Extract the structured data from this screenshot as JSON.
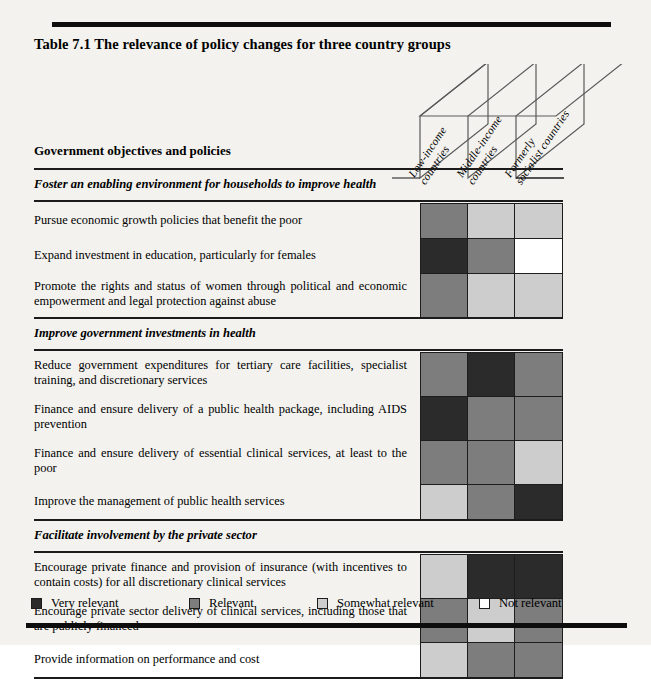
{
  "document": {
    "title": "Table 7.1  The relevance of policy changes for three country groups",
    "stub_head": "Government objectives and policies"
  },
  "columns": [
    {
      "label_line1": "Low-income",
      "label_line2": "countries"
    },
    {
      "label_line1": "Middle-income",
      "label_line2": "countries"
    },
    {
      "label_line1": "Formerly",
      "label_line2": "socialist countries"
    }
  ],
  "legend": [
    {
      "key": "very",
      "label": "Very relevant",
      "color": "#2b2b2b"
    },
    {
      "key": "relevant",
      "label": "Relevant",
      "color": "#7d7d7d"
    },
    {
      "key": "somewhat",
      "label": "Somewhat relevant",
      "color": "#cdcdcd"
    },
    {
      "key": "none",
      "label": "Not relevant",
      "color": "#ffffff"
    }
  ],
  "sections": [
    {
      "heading": "Foster an enabling environment for households to improve health",
      "rows": [
        {
          "label": "Pursue economic growth policies that benefit the poor",
          "values": [
            "relevant",
            "somewhat",
            "somewhat"
          ]
        },
        {
          "label": "Expand investment in education, particularly for females",
          "values": [
            "very",
            "relevant",
            "none"
          ]
        },
        {
          "label": "Promote the rights and status of women through political and economic empowerment and legal protection against abuse",
          "values": [
            "relevant",
            "somewhat",
            "somewhat"
          ]
        }
      ]
    },
    {
      "heading": "Improve government investments in health",
      "rows": [
        {
          "label": "Reduce government expenditures for tertiary care facilities, specialist training, and discretionary services",
          "values": [
            "relevant",
            "very",
            "relevant"
          ]
        },
        {
          "label": "Finance and ensure delivery of a public health package, including AIDS prevention",
          "values": [
            "very",
            "relevant",
            "relevant"
          ]
        },
        {
          "label": "Finance and ensure delivery of essential clinical services, at least to the poor",
          "values": [
            "relevant",
            "relevant",
            "somewhat"
          ]
        },
        {
          "label": "Improve the management of public health services",
          "values": [
            "somewhat",
            "relevant",
            "very"
          ]
        }
      ]
    },
    {
      "heading": "Facilitate involvement by the private sector",
      "rows": [
        {
          "label": "Encourage private finance and provision of insurance (with incentives to contain costs) for all discretionary clinical services",
          "values": [
            "somewhat",
            "very",
            "very"
          ]
        },
        {
          "label": "Encourage private sector delivery of clinical services, including those that are publicly financed",
          "values": [
            "relevant",
            "somewhat",
            "relevant"
          ]
        },
        {
          "label": "Provide information on performance and cost",
          "values": [
            "somewhat",
            "relevant",
            "relevant"
          ]
        }
      ]
    }
  ]
}
